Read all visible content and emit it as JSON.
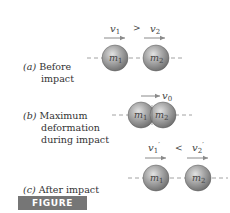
{
  "figure": {
    "label": "FIGURE 3/17",
    "colors": {
      "ball_light": "#d8d8d8",
      "ball_mid": "#a8a8a8",
      "ball_dark": "#6e6e6e",
      "arrow": "#8a8a8a",
      "dash_line": "#8a8a8a",
      "label_box": "#767676",
      "text": "#333333"
    }
  },
  "panels": [
    {
      "tag": "(a)",
      "caption_lines": [
        "Before",
        "impact"
      ],
      "relation": ">",
      "velocities": [
        {
          "symbol": "v",
          "sub": "1",
          "prime": ""
        },
        {
          "symbol": "v",
          "sub": "2",
          "prime": ""
        }
      ],
      "masses": [
        {
          "symbol": "m",
          "sub": "1"
        },
        {
          "symbol": "m",
          "sub": "2"
        }
      ]
    },
    {
      "tag": "(b)",
      "caption_lines": [
        "Maximum",
        "deformation",
        "during impact"
      ],
      "velocities": [
        {
          "symbol": "v",
          "sub": "0",
          "prime": ""
        }
      ],
      "masses": [
        {
          "symbol": "m",
          "sub": "1"
        },
        {
          "symbol": "m",
          "sub": "2"
        }
      ]
    },
    {
      "tag": "(c)",
      "caption_lines": [
        "After impact"
      ],
      "relation": "<",
      "velocities": [
        {
          "symbol": "v",
          "sub": "1",
          "prime": "′"
        },
        {
          "symbol": "v",
          "sub": "2",
          "prime": "′"
        }
      ],
      "masses": [
        {
          "symbol": "m",
          "sub": "1"
        },
        {
          "symbol": "m",
          "sub": "2"
        }
      ]
    }
  ]
}
